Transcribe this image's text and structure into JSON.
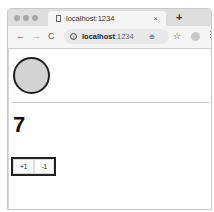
{
  "browser": {
    "tab": {
      "title": "localhost:1234",
      "close": "×"
    },
    "new_tab": "+",
    "nav": {
      "back": "←",
      "forward": "→",
      "reload": "C"
    },
    "address": {
      "host": "localhost",
      "port": ":1234"
    },
    "zoom_icon": "⊕",
    "bookmark_icon": "☆",
    "menu_icon": "⋮"
  },
  "page": {
    "count": "7",
    "buttons": {
      "increment": "+1",
      "decrement": "-1"
    }
  }
}
